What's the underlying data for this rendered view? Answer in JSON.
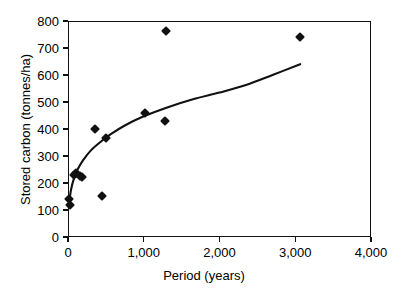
{
  "chart_data": {
    "type": "scatter",
    "title": "",
    "xlabel": "Period (years)",
    "ylabel": "Stored carbon (tonnes/ha)",
    "xlim": [
      0,
      4000
    ],
    "ylim": [
      0,
      800
    ],
    "xticks": [
      0,
      1000,
      2000,
      3000,
      4000
    ],
    "xtick_labels": [
      "0",
      "1,000",
      "2,000",
      "3,000",
      "4,000"
    ],
    "yticks": [
      0,
      100,
      200,
      300,
      400,
      500,
      600,
      700,
      800
    ],
    "ytick_labels": [
      "0",
      "100",
      "200",
      "300",
      "400",
      "500",
      "600",
      "700",
      "800"
    ],
    "grid": false,
    "legend": null,
    "marker": "diamond",
    "marker_color": "#111111",
    "points": [
      {
        "x": 13,
        "y": 140
      },
      {
        "x": 26,
        "y": 118
      },
      {
        "x": 79,
        "y": 230
      },
      {
        "x": 106,
        "y": 237
      },
      {
        "x": 158,
        "y": 226
      },
      {
        "x": 185,
        "y": 222
      },
      {
        "x": 356,
        "y": 400
      },
      {
        "x": 449,
        "y": 152
      },
      {
        "x": 502,
        "y": 367
      },
      {
        "x": 1016,
        "y": 459
      },
      {
        "x": 1280,
        "y": 430
      },
      {
        "x": 1293,
        "y": 763
      },
      {
        "x": 3061,
        "y": 741
      }
    ],
    "fit_curve": {
      "description": "logarithmic trend line",
      "color": "#111111",
      "x_start": 10,
      "x_end": 3065,
      "points": [
        {
          "x": 10,
          "y": 118
        },
        {
          "x": 40,
          "y": 175
        },
        {
          "x": 80,
          "y": 218
        },
        {
          "x": 130,
          "y": 252
        },
        {
          "x": 200,
          "y": 285
        },
        {
          "x": 300,
          "y": 320
        },
        {
          "x": 420,
          "y": 350
        },
        {
          "x": 560,
          "y": 380
        },
        {
          "x": 750,
          "y": 413
        },
        {
          "x": 1000,
          "y": 447
        },
        {
          "x": 1300,
          "y": 479
        },
        {
          "x": 1650,
          "y": 510
        },
        {
          "x": 2000,
          "y": 535
        },
        {
          "x": 2350,
          "y": 563
        },
        {
          "x": 2700,
          "y": 600
        },
        {
          "x": 3065,
          "y": 640
        }
      ]
    }
  },
  "axes": {
    "y_title": "Stored carbon (tonnes/ha)",
    "x_title": "Period (years)"
  }
}
